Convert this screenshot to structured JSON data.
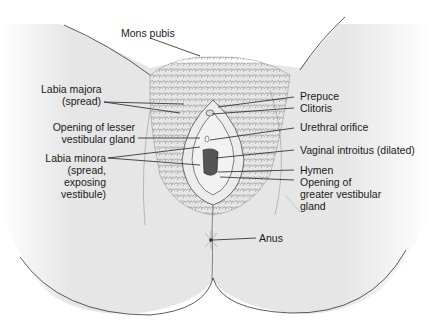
{
  "figure": {
    "colors": {
      "skin": "#e6e6e6",
      "line": "#2a2a2a",
      "text": "#1a1a1a",
      "background": "#ffffff",
      "introitus": "#555555"
    }
  },
  "labels": {
    "mons_pubis": {
      "lines": [
        "Mons pubis"
      ]
    },
    "labia_majora": {
      "lines": [
        "Labia majora",
        "(spread)"
      ]
    },
    "lesser_gland": {
      "lines": [
        "Opening of lesser",
        "vestibular gland"
      ]
    },
    "labia_minora": {
      "lines": [
        "Labia minora",
        "(spread,",
        "exposing",
        "vestibule)"
      ]
    },
    "prepuce": {
      "lines": [
        "Prepuce"
      ]
    },
    "clitoris": {
      "lines": [
        "Clitoris"
      ]
    },
    "urethral_orifice": {
      "lines": [
        "Urethral orifice"
      ]
    },
    "vaginal_introitus": {
      "lines": [
        "Vaginal introitus (dilated)"
      ]
    },
    "hymen": {
      "lines": [
        "Hymen"
      ]
    },
    "greater_gland": {
      "lines": [
        "Opening of",
        "greater vestibular",
        "gland"
      ]
    },
    "anus": {
      "lines": [
        "Anus"
      ]
    }
  }
}
